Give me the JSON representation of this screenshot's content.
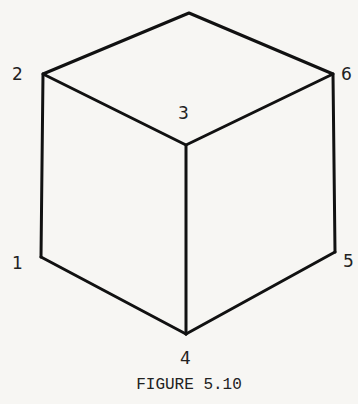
{
  "figure": {
    "caption": "FIGURE 5.10",
    "vertex_labels": {
      "v1": "1",
      "v2": "2",
      "v3": "3",
      "v4": "4",
      "v5": "5",
      "v6": "6"
    },
    "stroke_color": "#111111",
    "background": "#f7f6f3"
  }
}
